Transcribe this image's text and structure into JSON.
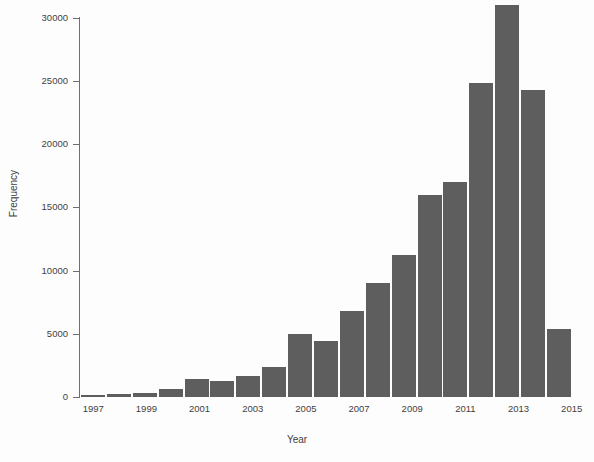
{
  "chart_data": {
    "type": "bar",
    "title": "",
    "xlabel": "Year",
    "ylabel": "Frequency",
    "categories": [
      "1997",
      "1998",
      "1999",
      "2000",
      "2001",
      "2002",
      "2003",
      "2004",
      "2005",
      "2006",
      "2007",
      "2008",
      "2009",
      "2010",
      "2011",
      "2012",
      "2013",
      "2014",
      "2015"
    ],
    "values": [
      150,
      250,
      350,
      600,
      1400,
      1250,
      1700,
      2400,
      5000,
      4400,
      6800,
      9000,
      11200,
      16000,
      17000,
      24800,
      31000,
      24300,
      5400
    ],
    "x_tick_labels": [
      "1997",
      "1999",
      "2001",
      "2003",
      "2005",
      "2007",
      "2009",
      "2011",
      "2013",
      "2015"
    ],
    "y_tick_labels": [
      "0",
      "5000",
      "10000",
      "15000",
      "20000",
      "25000",
      "30000"
    ],
    "y_tick_values": [
      0,
      5000,
      10000,
      15000,
      20000,
      25000,
      30000
    ],
    "ylim": [
      0,
      31500
    ],
    "grid": false,
    "legend": false,
    "bar_color": "#5e5e5e",
    "background_color": "#ffffff",
    "axis_color": "#6f6f6f"
  }
}
